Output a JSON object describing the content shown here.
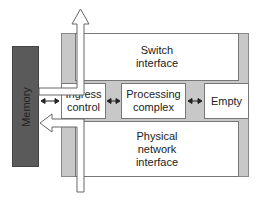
{
  "diagram": {
    "memory_label": "Memory",
    "switch_interface": "Switch\ninterface",
    "ingress_control": "Ingress\ncontrol",
    "processing_complex": "Processing\ncomplex",
    "empty": "Empty",
    "physical_network_interface": "Physical\nnetwork\ninterface",
    "colors": {
      "memory": "#5a5a5a",
      "frame": "#c8c8c8",
      "box": "#ffffff",
      "line": "#777777"
    }
  }
}
